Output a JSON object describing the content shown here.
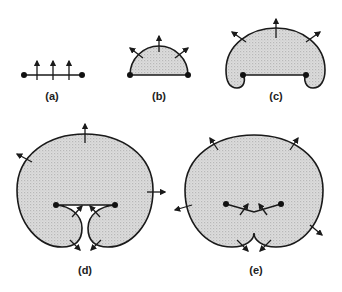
{
  "figure": {
    "panels": [
      {
        "id": "a",
        "label": "(a)",
        "description": "Initial segment with two endpoints and three outward normal arrows"
      },
      {
        "id": "b",
        "label": "(b)",
        "description": "Front expands into a semicircular arc, shaded region, three normal arrows"
      },
      {
        "id": "c",
        "label": "(c)",
        "description": "Front curls around endpoints, three normal arrows"
      },
      {
        "id": "d",
        "label": "(d)",
        "description": "Large shaded region, curls approaching each other near endpoints, normal arrows"
      },
      {
        "id": "e",
        "label": "(e)",
        "description": "Curls merge forming a cusp at the bottom; normal arrows outward"
      }
    ],
    "colors": {
      "ink": "#1a1a1a",
      "shade": "#cfcfcf",
      "background": "#ffffff"
    }
  }
}
